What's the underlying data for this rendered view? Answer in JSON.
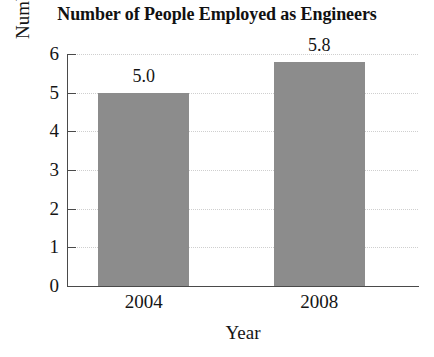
{
  "chart_data": {
    "type": "bar",
    "title": "Number of People Employed as Engineers",
    "xlabel": "Year",
    "ylabel": "Number (millions)",
    "categories": [
      "2004",
      "2008"
    ],
    "values": [
      5.0,
      5.8
    ],
    "value_labels": [
      "5.0",
      "5.8"
    ],
    "ylim": [
      0,
      6
    ],
    "yticks": [
      0,
      1,
      2,
      3,
      4,
      5,
      6
    ],
    "ytick_labels": [
      "0",
      "1",
      "2",
      "3",
      "4",
      "5",
      "6"
    ],
    "grid": "horizontal-dotted",
    "legend": "none",
    "bar_color": "#8c8c8c",
    "axis_color": "#4a4a4a",
    "grid_color": "#cfcfcf",
    "background_color": "#ffffff"
  }
}
